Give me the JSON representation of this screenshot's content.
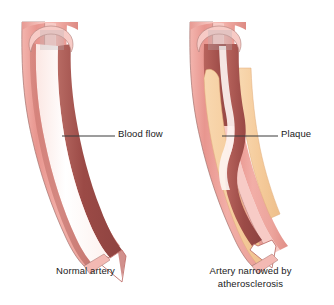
{
  "figure": {
    "background_color": "#ffffff"
  },
  "callouts": [
    {
      "id": "blood-flow",
      "label": "Blood flow",
      "leader_line_color": "#3a3a3a",
      "points_to": "lumen of normal artery"
    },
    {
      "id": "plaque",
      "label": "Plaque",
      "leader_line_color": "#3a3a3a",
      "points_to": "fatty deposit inside narrowed artery"
    }
  ],
  "captions": {
    "left": {
      "lines": [
        "Normal artery"
      ]
    },
    "right": {
      "lines": [
        "Artery narrowed by",
        "atherosclerosis"
      ]
    }
  },
  "colors": {
    "vessel_wall_outer": "#e8968f",
    "vessel_wall_mid": "#f0a9a2",
    "vessel_wall_light": "#f7c9c4",
    "vessel_wall_highlight": "#fdeeec",
    "vessel_outline": "#9c6b68",
    "blood_dark": "#9e4a48",
    "blood_mid": "#b85d58",
    "lumen_light": "#fdf6f4",
    "lumen_white": "#ffffff",
    "plaque_fill": "#f6cfa2",
    "plaque_shade": "#efbf8a",
    "text": "#1a1a1a",
    "leader_line": "#3a3a3a"
  },
  "anatomy": {
    "left_vessel": {
      "name": "normal artery",
      "lumen_state": "open",
      "cutaway": "longitudinal section with rounded opening at top"
    },
    "right_vessel": {
      "name": "atherosclerotic artery",
      "lumen_state": "narrowed",
      "cutaway": "longitudinal section with rounded opening at top",
      "deposit": "plaque lining both walls leaving narrow channel"
    }
  }
}
